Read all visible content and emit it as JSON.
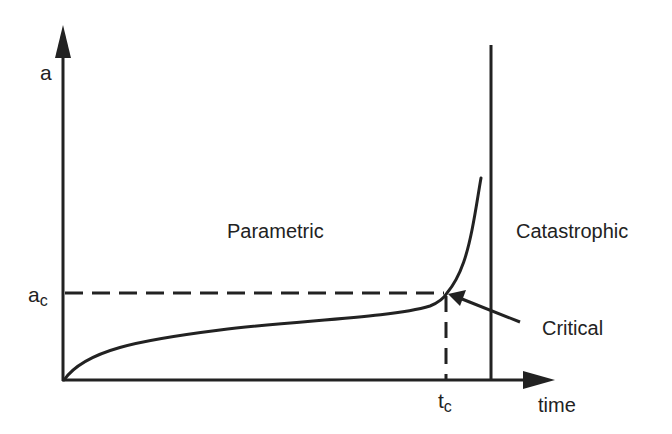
{
  "diagram": {
    "y_axis_label": "a",
    "x_axis_label": "time",
    "critical_level_label": "a",
    "critical_level_sub": "c",
    "critical_time_label": "t",
    "critical_time_sub": "c",
    "region_left_label": "Parametric",
    "region_right_label": "Catastrophic",
    "critical_point_label": "Critical",
    "colors": {
      "ink": "#222222",
      "background": "#ffffff"
    }
  }
}
